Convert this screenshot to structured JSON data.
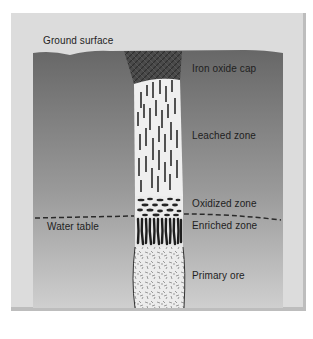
{
  "diagram": {
    "type": "geological cross-section",
    "labels": {
      "ground_surface": "Ground surface",
      "water_table": "Water table",
      "iron_oxide_cap": "Iron oxide cap",
      "leached_zone": "Leached zone",
      "oxidized_zone": "Oxidized zone",
      "enriched_zone": "Enriched zone",
      "primary_ore": "Primary ore"
    },
    "zones_top_to_bottom": [
      "Iron oxide cap",
      "Leached zone",
      "Oxidized zone",
      "Enriched zone",
      "Primary ore"
    ],
    "colors": {
      "background": "#ffffff",
      "frame": "#dcdcdc",
      "ground_top": "#676767",
      "ground_bottom": "#cdcdcd",
      "cap": "#4a4a4a",
      "column_fill": "#eeeeee",
      "marks": "#2a2a2a"
    }
  }
}
